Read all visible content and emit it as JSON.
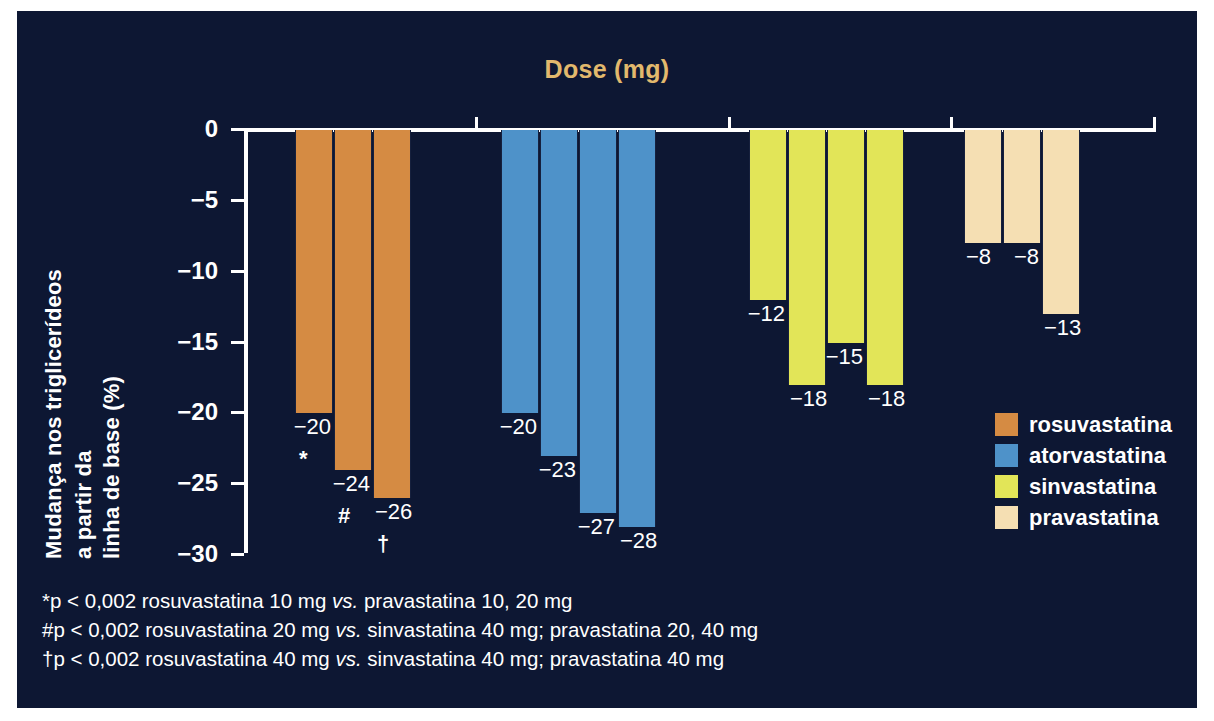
{
  "figure": {
    "background_color": "#0d1733",
    "dose_title": "Dose (mg)",
    "dose_title_color": "#e2b96d",
    "ylabel_lines": [
      "Mudança nos triglicerídeos",
      "a partir da",
      "linha de base (%)"
    ]
  },
  "chart_data": {
    "type": "bar",
    "title": "Dose (mg)",
    "xlabel": "Dose (mg)",
    "ylabel": "Mudança nos triglicerídeos a partir da linha de base (%)",
    "ylim": [
      -30,
      0
    ],
    "yticks": [
      "0",
      "−5",
      "−10",
      "−15",
      "−20",
      "−25",
      "−30"
    ],
    "ytick_values": [
      0,
      -5,
      -10,
      -15,
      -20,
      -25,
      -30
    ],
    "grid": false,
    "legend_position": "right",
    "groups": [
      {
        "name": "rosuvastatina",
        "color": "#d58b43",
        "doses": [
          "10",
          "20",
          "40"
        ],
        "values": [
          -20,
          -24,
          -26
        ],
        "value_labels": [
          "−20",
          "−24",
          "−26"
        ],
        "significance": [
          "*",
          "#",
          "†"
        ]
      },
      {
        "name": "atorvastatina",
        "color": "#4e92c9",
        "doses": [
          "10",
          "20",
          "40",
          "80"
        ],
        "values": [
          -20,
          -23,
          -27,
          -28
        ],
        "value_labels": [
          "−20",
          "−23",
          "−27",
          "−28"
        ],
        "significance": [
          "",
          "",
          "",
          ""
        ]
      },
      {
        "name": "sinvastatina",
        "color": "#e2e558",
        "doses": [
          "10",
          "20",
          "40",
          "80"
        ],
        "values": [
          -12,
          -18,
          -15,
          -18
        ],
        "value_labels": [
          "−12",
          "−18",
          "−15",
          "−18"
        ],
        "significance": [
          "",
          "",
          "",
          ""
        ]
      },
      {
        "name": "pravastatina",
        "color": "#f5dfb3",
        "doses": [
          "10",
          "20",
          "40"
        ],
        "values": [
          -8,
          -8,
          -13
        ],
        "value_labels": [
          "−8",
          "−8",
          "−13"
        ],
        "significance": [
          "",
          "",
          ""
        ]
      }
    ]
  },
  "legend": {
    "items": [
      {
        "label": "rosuvastatina",
        "color": "#d58b43"
      },
      {
        "label": "atorvastatina",
        "color": "#4e92c9"
      },
      {
        "label": "sinvastatina",
        "color": "#e2e558"
      },
      {
        "label": "pravastatina",
        "color": "#f5dfb3"
      }
    ]
  },
  "footnotes": [
    {
      "pre": "*p < 0,002 rosuvastatina 10 mg ",
      "vs": "vs.",
      "post": " pravastatina 10, 20 mg"
    },
    {
      "pre": "#p < 0,002 rosuvastatina 20 mg ",
      "vs": "vs.",
      "post": " sinvastatina 40 mg; pravastatina 20, 40 mg"
    },
    {
      "pre": "†p < 0,002 rosuvastatina 40 mg ",
      "vs": "vs.",
      "post": " sinvastatina 40 mg; pravastatina 40 mg"
    }
  ]
}
